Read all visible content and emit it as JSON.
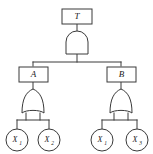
{
  "figure": {
    "name": "fault-tree-diagram",
    "background_color": "#ffffff",
    "line_color": "#3a3a3a",
    "text_color": "#1a1a1a"
  },
  "nodes": {
    "top_event": {
      "label": "T",
      "shape": "rectangle",
      "role": "top-event"
    },
    "intermediate_left": {
      "label": "A",
      "shape": "rectangle",
      "role": "intermediate-event"
    },
    "intermediate_right": {
      "label": "B",
      "shape": "rectangle",
      "role": "intermediate-event"
    }
  },
  "gates": {
    "top_gate": {
      "type": "AND",
      "icon": "and-gate-icon",
      "output_to": "T",
      "inputs_from": [
        "A",
        "B"
      ]
    },
    "left_gate": {
      "type": "OR",
      "icon": "or-gate-icon",
      "output_to": "A",
      "inputs_from": [
        "X1",
        "X2"
      ]
    },
    "right_gate": {
      "type": "OR",
      "icon": "or-gate-icon",
      "output_to": "B",
      "inputs_from": [
        "X1",
        "X3"
      ]
    }
  },
  "basic_events": [
    {
      "id": "be-1",
      "base": "X",
      "subscript": "1",
      "label": "X1",
      "shape": "circle",
      "parent": "A"
    },
    {
      "id": "be-2",
      "base": "X",
      "subscript": "2",
      "label": "X2",
      "shape": "circle",
      "parent": "A"
    },
    {
      "id": "be-3",
      "base": "X",
      "subscript": "1",
      "label": "X1",
      "shape": "circle",
      "parent": "B"
    },
    {
      "id": "be-4",
      "base": "X",
      "subscript": "3",
      "label": "X3",
      "shape": "circle",
      "parent": "B"
    }
  ]
}
